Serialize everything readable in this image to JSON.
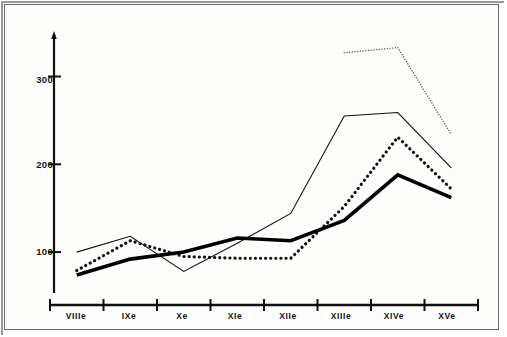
{
  "chart_data": {
    "type": "line",
    "title": "",
    "subtitle": "",
    "xlabel": "",
    "ylabel": "",
    "categories": [
      "VIIIe",
      "IXe",
      "Xe",
      "XIe",
      "XIIe",
      "XIIIe",
      "XIVe",
      "XVe"
    ],
    "x_tick_labels": [
      "VIIIe",
      "IXe",
      "Xe",
      "XIe",
      "XIIe",
      "XIIIe",
      "XIVe",
      "XVe"
    ],
    "y_tick_labels": [
      "100",
      "200",
      "300"
    ],
    "y_ticks": [
      100,
      200,
      300
    ],
    "ylim": [
      50,
      345
    ],
    "xlim": [
      0,
      7
    ],
    "grid": false,
    "legend": "none",
    "series": [
      {
        "name": "thin-solid",
        "style": "solid-thin",
        "color": "#111111",
        "values": [
          100,
          118,
          78,
          110,
          144,
          255,
          259,
          196
        ]
      },
      {
        "name": "medium-dotted",
        "style": "dotted-bold",
        "color": "#111111",
        "values": [
          79,
          113,
          95,
          93,
          93,
          152,
          231,
          172
        ]
      },
      {
        "name": "thick-solid",
        "style": "solid-thick",
        "color": "#000000",
        "values": [
          74,
          92,
          100,
          116,
          113,
          136,
          188,
          162
        ]
      },
      {
        "name": "fine-dotted-upper",
        "style": "dotted-fine",
        "color": "#444444",
        "values": [
          null,
          null,
          null,
          null,
          null,
          327,
          333,
          234
        ]
      }
    ]
  },
  "axis": {
    "y_axis_name": "value-axis",
    "x_axis_name": "century-axis"
  }
}
